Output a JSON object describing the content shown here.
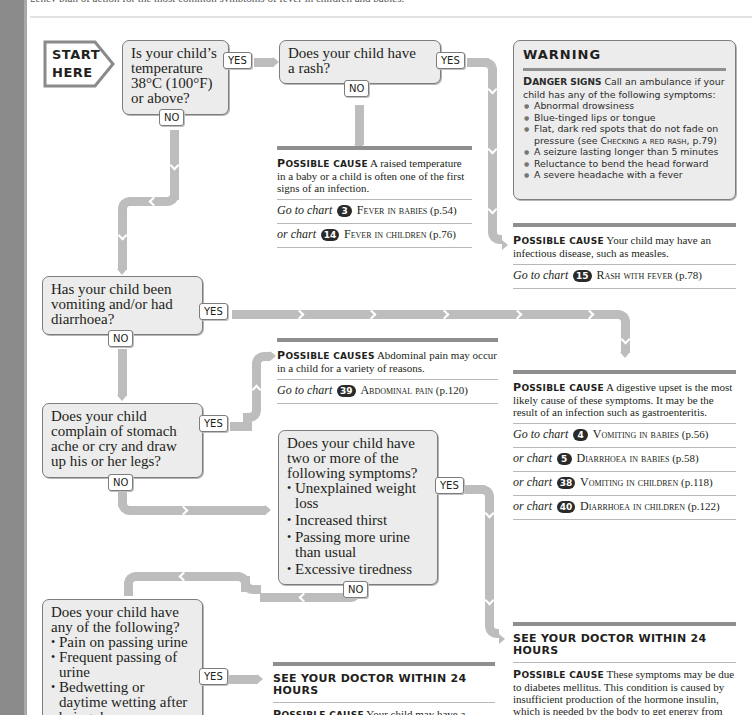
{
  "page": {
    "top_text": "gency plan of action for the most common symptoms of fever in children and babies."
  },
  "start": {
    "line1": "START",
    "line2": "HERE"
  },
  "q1": {
    "text": "Is your child's temperature 38°C (100°F) or above?",
    "lines": [
      "Is your child’s",
      "temperature",
      "38°C (100°F)",
      "or above?"
    ],
    "yes": "YES",
    "no": "NO"
  },
  "q2": {
    "lines": [
      "Does your child have",
      "a rash?"
    ],
    "yes": "YES",
    "no": "NO"
  },
  "result_fever": {
    "label_cap": "P",
    "label_rest": "OSSIBLE CAUSE",
    "text": "A raised temperature in a baby or a child is often one of the first signs of an infection.",
    "charts": [
      {
        "prefix": "Go to chart",
        "num": "3",
        "title": "Fever in babies",
        "page": "(p.54)"
      },
      {
        "prefix": "or chart",
        "num": "14",
        "title": "Fever in children",
        "page": "(p.76)"
      }
    ]
  },
  "warning": {
    "title": "WARNING",
    "lead_cap": "D",
    "lead_rest": "ANGER SIGNS",
    "lead_text": "Call an ambulance if your child has any of the following symptoms:",
    "items": [
      "Abnormal drowsiness",
      "Blue-tinged lips or tongue",
      "Flat, dark red spots that do not fade on pressure (see",
      "A seizure lasting longer than 5 minutes",
      "Reluctance to bend the head forward",
      "A severe headache with a fever"
    ],
    "item3_ref": "Checking a red rash",
    "item3_end": ", p.79)"
  },
  "result_rash": {
    "label_cap": "P",
    "label_rest": "OSSIBLE CAUSE",
    "text": "Your child may have an infectious disease, such as measles.",
    "charts": [
      {
        "prefix": "Go to chart",
        "num": "15",
        "title": "Rash with fever",
        "page": "(p.78)"
      }
    ]
  },
  "q3": {
    "lines": [
      "Has your child been",
      "vomiting and/or had",
      "diarrhoea?"
    ],
    "yes": "YES",
    "no": "NO"
  },
  "result_abdominal": {
    "label_cap": "P",
    "label_rest": "OSSIBLE CAUSES",
    "text": "Abdominal pain may occur in a child for a variety of reasons.",
    "charts": [
      {
        "prefix": "Go to chart",
        "num": "39",
        "title": "Abdominal pain",
        "page": "(p.120)"
      }
    ]
  },
  "result_digestive": {
    "label_cap": "P",
    "label_rest": "OSSIBLE CAUSE",
    "text": "A digestive upset is the most likely cause of these symptoms. It may be the result of an infection such as gastroenteritis.",
    "charts": [
      {
        "prefix": "Go to chart",
        "num": "4",
        "title": "Vomiting in babies",
        "page": "(p.56)"
      },
      {
        "prefix": "or chart",
        "num": "5",
        "title": "Diarrhoea in babies",
        "page": "(p.58)"
      },
      {
        "prefix": "or chart",
        "num": "38",
        "title": "Vomiting in children",
        "page": "(p.118)"
      },
      {
        "prefix": "or chart",
        "num": "40",
        "title": "Diarrhoea in children",
        "page": "(p.122)"
      }
    ]
  },
  "q4": {
    "lines": [
      "Does your child",
      "complain of stomach",
      "ache or cry and draw",
      "up his or her legs?"
    ],
    "yes": "YES",
    "no": "NO"
  },
  "q5": {
    "lines": [
      "Does your child have",
      "two or more of the",
      "following symptoms?"
    ],
    "items": [
      "Unexplained weight loss",
      "Increased thirst",
      "Passing more urine than usual",
      "Excessive tiredness"
    ],
    "yes": "YES",
    "no": "NO"
  },
  "q6": {
    "lines": [
      "Does your child have",
      "any of the following?"
    ],
    "items": [
      "Pain on passing urine",
      "Frequent passing of urine",
      "Bedwetting or daytime wetting after being dry"
    ],
    "yes": "YES"
  },
  "result_uti": {
    "heading": "SEE YOUR DOCTOR WITHIN 24 HOURS",
    "label_cap": "P",
    "label_rest": "OSSIBLE CAUSE",
    "text": "Your child may have a urinary tract infection (p.126)."
  },
  "result_diabetes": {
    "heading": "SEE YOUR DOCTOR WITHIN 24 HOURS",
    "label_cap": "P",
    "label_rest": "OSSIBLE CAUSE",
    "text": "These symptoms may be due to diabetes mellitus. This condition is caused by insufficient production of the hormone insulin, which is needed by the body to get energy from sugar and carbohydrate foods."
  },
  "colors": {
    "pipe": "#bdbdbd",
    "box_fill": "#ececec",
    "box_border": "#7d7d7d",
    "rule": "#8f8f8f",
    "badge": "#2a2a2a",
    "side_strip": "#8b8b8b"
  }
}
